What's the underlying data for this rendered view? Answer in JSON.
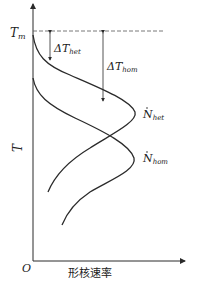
{
  "diagram": {
    "y_axis_label": "T",
    "x_axis_label": "形核速率",
    "origin_label": "O",
    "tm_label": {
      "main": "T",
      "sub": "m"
    },
    "delta_het": {
      "main": "ΔT",
      "sub": "het"
    },
    "delta_hom": {
      "main": "ΔT",
      "sub": "hom"
    },
    "curve_het": {
      "main": "N",
      "sub": "het"
    },
    "curve_hom": {
      "main": "N",
      "sub": "hom"
    },
    "colors": {
      "line": "#2a2a2a",
      "dash": "#555555"
    }
  }
}
